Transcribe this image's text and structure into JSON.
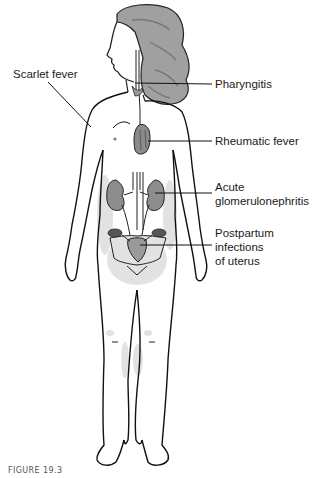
{
  "figure": {
    "caption": "FIGURE 19.3",
    "colors": {
      "outline": "#111111",
      "hair": "#9a9a9a",
      "organ_fill": "#8c8c8c",
      "shading": "#d4d4d4",
      "leader_line": "#111111"
    }
  },
  "labels": [
    {
      "id": "scarlet-fever",
      "lines": [
        "Scarlet fever"
      ],
      "side": "left"
    },
    {
      "id": "pharyngitis",
      "lines": [
        "Pharyngitis"
      ],
      "side": "right"
    },
    {
      "id": "rheumatic-fever",
      "lines": [
        "Rheumatic fever"
      ],
      "side": "right"
    },
    {
      "id": "acute-glomerulonephritis",
      "lines": [
        "Acute",
        "glomerulonephritis"
      ],
      "side": "right"
    },
    {
      "id": "postpartum-infections",
      "lines": [
        "Postpartum",
        "infections",
        "of uterus"
      ],
      "side": "right"
    }
  ]
}
